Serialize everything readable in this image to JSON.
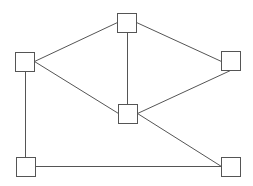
{
  "diagram": {
    "type": "undirected-graph",
    "colors": {
      "background": "#ffffff",
      "stroke": "#555555",
      "node_fill": "#ffffff"
    },
    "node_size": 19,
    "nodes": [
      {
        "id": "top-center",
        "x": 117,
        "y": 13
      },
      {
        "id": "left",
        "x": 15,
        "y": 52
      },
      {
        "id": "right",
        "x": 221,
        "y": 51
      },
      {
        "id": "center",
        "x": 118,
        "y": 104
      },
      {
        "id": "bottom-left",
        "x": 16,
        "y": 157
      },
      {
        "id": "bottom-right",
        "x": 221,
        "y": 157
      }
    ],
    "edges": [
      {
        "from": "top-center",
        "to": "left",
        "x1": 117,
        "y1": 22,
        "x2": 34,
        "y2": 61
      },
      {
        "from": "top-center",
        "to": "right",
        "x1": 136,
        "y1": 22,
        "x2": 221,
        "y2": 61
      },
      {
        "from": "top-center",
        "to": "center",
        "x1": 127,
        "y1": 32,
        "x2": 127,
        "y2": 104
      },
      {
        "from": "left",
        "to": "center",
        "x1": 34,
        "y1": 61,
        "x2": 118,
        "y2": 113
      },
      {
        "from": "left",
        "to": "bottom-left",
        "x1": 25,
        "y1": 71,
        "x2": 25,
        "y2": 157
      },
      {
        "from": "right",
        "to": "center",
        "x1": 230,
        "y1": 70,
        "x2": 137,
        "y2": 113
      },
      {
        "from": "center",
        "to": "bottom-right",
        "x1": 137,
        "y1": 113,
        "x2": 221,
        "y2": 166
      },
      {
        "from": "bottom-left",
        "to": "bottom-right",
        "x1": 35,
        "y1": 166,
        "x2": 221,
        "y2": 166
      }
    ]
  }
}
